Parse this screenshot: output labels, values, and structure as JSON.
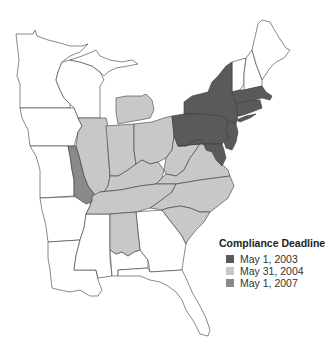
{
  "legend": {
    "title": "Compliance Deadline",
    "items": [
      {
        "label": "May 1, 2003",
        "color": "#5a5a5a"
      },
      {
        "label": "May 31, 2004",
        "color": "#c8c8c8"
      },
      {
        "label": "May 1, 2007",
        "color": "#8a8a8a"
      }
    ]
  },
  "map": {
    "region": "Eastern United States",
    "states": {
      "may_1_2003": [
        "New York",
        "Pennsylvania",
        "New Jersey",
        "Delaware",
        "Maryland",
        "Connecticut",
        "Rhode Island",
        "Massachusetts",
        "District of Columbia"
      ],
      "may_31_2004": [
        "Michigan (lower peninsula)",
        "Illinois",
        "Indiana",
        "Ohio",
        "Kentucky",
        "West Virginia",
        "Virginia",
        "Tennessee",
        "North Carolina",
        "South Carolina",
        "Alabama (northern)"
      ],
      "may_1_2007": [
        "Missouri (eastern)"
      ],
      "none": [
        "Minnesota",
        "Wisconsin",
        "Iowa",
        "Michigan (upper peninsula)",
        "Arkansas",
        "Louisiana",
        "Mississippi",
        "Georgia",
        "Florida",
        "Maine",
        "New Hampshire",
        "Vermont",
        "Alabama (southern)",
        "Missouri (western)"
      ]
    }
  }
}
